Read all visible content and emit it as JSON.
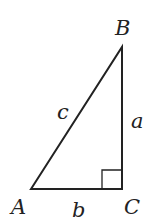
{
  "diagram": {
    "vertices": {
      "A": {
        "label": "A",
        "x": 31,
        "y": 189
      },
      "B": {
        "label": "B",
        "x": 122,
        "y": 47
      },
      "C": {
        "label": "C",
        "x": 122,
        "y": 189
      }
    },
    "sides": {
      "a": {
        "label": "a",
        "between": [
          "B",
          "C"
        ]
      },
      "b": {
        "label": "b",
        "between": [
          "A",
          "C"
        ]
      },
      "c": {
        "label": "c",
        "between": [
          "A",
          "B"
        ]
      }
    },
    "right_angle_at": "C",
    "colors": {
      "line": "#222222",
      "background": "#ffffff"
    }
  }
}
